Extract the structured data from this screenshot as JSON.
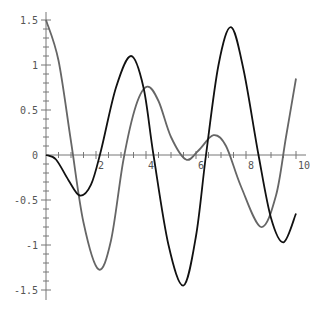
{
  "chart_data": {
    "type": "line",
    "title": "",
    "xlabel": "",
    "ylabel": "",
    "xlim": [
      0,
      10
    ],
    "ylim": [
      -1.5,
      1.5
    ],
    "grid": false,
    "x_ticks": [
      "2",
      "4",
      "6",
      "8",
      "10"
    ],
    "y_ticks": [
      "1.5",
      "1",
      "0.5",
      "0",
      "-0.5",
      "-1",
      "-1.5"
    ],
    "series": [
      {
        "name": "gray curve",
        "color": "#666666",
        "x": [
          0,
          0.5,
          1.0,
          1.5,
          2.1,
          2.6,
          3.1,
          3.6,
          4.05,
          4.5,
          5.0,
          5.6,
          6.1,
          6.7,
          7.2,
          7.8,
          8.6,
          9.2,
          9.6,
          10
        ],
        "y": [
          1.5,
          1.05,
          0.15,
          -0.75,
          -1.27,
          -0.95,
          -0.05,
          0.55,
          0.76,
          0.6,
          0.2,
          -0.05,
          0.05,
          0.22,
          0.1,
          -0.35,
          -0.8,
          -0.45,
          0.2,
          0.85
        ]
      },
      {
        "name": "black curve",
        "color": "#111111",
        "x": [
          0,
          0.4,
          0.9,
          1.35,
          1.8,
          2.2,
          2.8,
          3.4,
          3.9,
          4.3,
          4.9,
          5.5,
          6.0,
          6.4,
          6.9,
          7.4,
          7.9,
          8.5,
          9.0,
          9.5,
          10
        ],
        "y": [
          0,
          -0.05,
          -0.28,
          -0.45,
          -0.33,
          0.05,
          0.75,
          1.1,
          0.75,
          0.0,
          -1.0,
          -1.45,
          -0.9,
          0.0,
          1.0,
          1.42,
          0.95,
          0.0,
          -0.7,
          -0.97,
          -0.65
        ]
      }
    ]
  }
}
